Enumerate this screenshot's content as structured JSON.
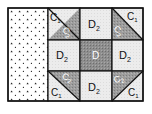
{
  "diagram": {
    "type": "quilt-block-layout",
    "colors": {
      "light": "#ececec",
      "dark": "#9a9a9a",
      "center": "#8a8a8a",
      "border": "#111111",
      "print_background": "#ffffff",
      "print_dot": "#222222"
    },
    "side_panel": {
      "label": "",
      "pattern": "dotted-print"
    },
    "cells": [
      {
        "row": 0,
        "col": 0,
        "kind": "half-square-triangle",
        "diagonal": "tl-br-upper-light",
        "light_label": "C",
        "light_sub": "1",
        "dark_label": "C",
        "dark_sub": "2"
      },
      {
        "row": 0,
        "col": 1,
        "kind": "square",
        "label": "D",
        "sub": "2"
      },
      {
        "row": 0,
        "col": 2,
        "kind": "half-square-triangle",
        "diagonal": "tl-br-upper-light",
        "light_label": "C",
        "light_sub": "1",
        "dark_label": "C",
        "dark_sub": "2"
      },
      {
        "row": 1,
        "col": 0,
        "kind": "square",
        "label": "D",
        "sub": "2"
      },
      {
        "row": 1,
        "col": 1,
        "kind": "center-square",
        "label": "D",
        "sub": ""
      },
      {
        "row": 1,
        "col": 2,
        "kind": "square",
        "label": "D",
        "sub": "2"
      },
      {
        "row": 2,
        "col": 0,
        "kind": "half-square-triangle",
        "light_label": "C",
        "light_sub": "1",
        "dark_label": "C",
        "dark_sub": "2"
      },
      {
        "row": 2,
        "col": 1,
        "kind": "square",
        "label": "D",
        "sub": "2"
      },
      {
        "row": 2,
        "col": 2,
        "kind": "half-square-triangle",
        "light_label": "C",
        "light_sub": "1",
        "dark_label": "C",
        "dark_sub": "2"
      }
    ],
    "labels": {
      "c1": "C",
      "c1_sub": "1",
      "c2": "C",
      "c2_sub": "2",
      "d2": "D",
      "d2_sub": "2",
      "d": "D"
    }
  }
}
